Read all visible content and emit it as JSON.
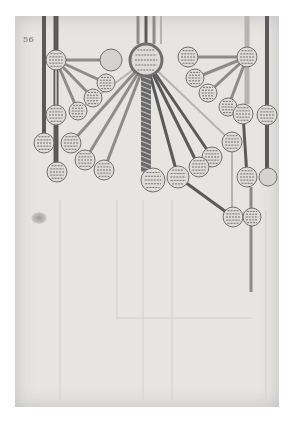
{
  "document": {
    "type": "manuscript-facsimile",
    "page_number": "56",
    "description": "Genealogical tree diagram with central braided trunk and roundel medallions connected by bars",
    "colors": {
      "background": "#ffffff",
      "parchment": "#e6e5e2",
      "ink_dark": "#5a5a5a",
      "bar_mid": "#8c8c8c",
      "bar_light": "#b4b4b4",
      "roundel_fill": "#dedcd8"
    },
    "central_roundel": {
      "label": "illegible manuscript text",
      "x": 146,
      "y": 60,
      "r": 16
    },
    "trunk": {
      "x": 146,
      "top": 76,
      "bottom": 172
    },
    "base_roundel": {
      "label": "illegible manuscript text",
      "x": 153,
      "y": 180,
      "r": 12
    },
    "roundels": [
      {
        "id": "l1",
        "x": 56,
        "y": 60,
        "r": 10,
        "label": "illegible manuscript text"
      },
      {
        "id": "l2",
        "x": 111,
        "y": 60,
        "r": 11,
        "label": "",
        "empty": true
      },
      {
        "id": "l3",
        "x": 106,
        "y": 83,
        "r": 9,
        "label": "illegible manuscript text"
      },
      {
        "id": "l4",
        "x": 93,
        "y": 98,
        "r": 9,
        "label": "illegible manuscript text"
      },
      {
        "id": "l5",
        "x": 78,
        "y": 111,
        "r": 9,
        "label": "illegible manuscript text"
      },
      {
        "id": "l6",
        "x": 56,
        "y": 115,
        "r": 10,
        "label": "illegible manuscript text"
      },
      {
        "id": "l7",
        "x": 44,
        "y": 143,
        "r": 10,
        "label": "illegible manuscript text"
      },
      {
        "id": "l8",
        "x": 71,
        "y": 143,
        "r": 10,
        "label": "illegible manuscript text"
      },
      {
        "id": "l9",
        "x": 85,
        "y": 160,
        "r": 10,
        "label": "illegible manuscript text"
      },
      {
        "id": "l10",
        "x": 104,
        "y": 170,
        "r": 10,
        "label": "illegible manuscript text"
      },
      {
        "id": "l11",
        "x": 57,
        "y": 172,
        "r": 10,
        "label": "illegible manuscript text"
      },
      {
        "id": "r1",
        "x": 188,
        "y": 57,
        "r": 10,
        "label": "illegible manuscript text"
      },
      {
        "id": "r2",
        "x": 247,
        "y": 57,
        "r": 10,
        "label": "illegible manuscript text"
      },
      {
        "id": "r3",
        "x": 195,
        "y": 78,
        "r": 9,
        "label": "illegible manuscript text"
      },
      {
        "id": "r4",
        "x": 208,
        "y": 93,
        "r": 9,
        "label": "illegible manuscript text"
      },
      {
        "id": "r5",
        "x": 228,
        "y": 107,
        "r": 9,
        "label": "illegible manuscript text"
      },
      {
        "id": "r6",
        "x": 243,
        "y": 114,
        "r": 10,
        "label": "illegible manuscript text"
      },
      {
        "id": "r7",
        "x": 267,
        "y": 115,
        "r": 10,
        "label": "illegible manuscript text"
      },
      {
        "id": "r8",
        "x": 232,
        "y": 142,
        "r": 10,
        "label": "illegible manuscript text"
      },
      {
        "id": "r9",
        "x": 212,
        "y": 157,
        "r": 10,
        "label": "illegible manuscript text"
      },
      {
        "id": "r10",
        "x": 199,
        "y": 167,
        "r": 10,
        "label": "illegible manuscript text"
      },
      {
        "id": "r11",
        "x": 178,
        "y": 177,
        "r": 11,
        "label": "illegible manuscript text"
      },
      {
        "id": "r12",
        "x": 247,
        "y": 177,
        "r": 10,
        "label": "illegible manuscript text"
      },
      {
        "id": "r13",
        "x": 268,
        "y": 177,
        "r": 9,
        "label": "",
        "empty": true
      },
      {
        "id": "r14",
        "x": 233,
        "y": 217,
        "r": 10,
        "label": "illegible manuscript text"
      },
      {
        "id": "r15",
        "x": 252,
        "y": 217,
        "r": 9,
        "label": "illegible manuscript text"
      }
    ],
    "vertical_bars": [
      {
        "x": 44,
        "top": 16,
        "bottom": 136,
        "w": 4,
        "tone": "ink_dark"
      },
      {
        "x": 56,
        "top": 16,
        "bottom": 163,
        "w": 5,
        "tone": "ink_dark"
      },
      {
        "x": 138,
        "top": 16,
        "bottom": 44,
        "w": 3,
        "tone": "bar_mid"
      },
      {
        "x": 146,
        "top": 16,
        "bottom": 44,
        "w": 3,
        "tone": "ink_dark"
      },
      {
        "x": 154,
        "top": 16,
        "bottom": 44,
        "w": 3,
        "tone": "bar_mid"
      },
      {
        "x": 161,
        "top": 16,
        "bottom": 44,
        "w": 2,
        "tone": "bar_light"
      },
      {
        "x": 247,
        "top": 16,
        "bottom": 104,
        "w": 5,
        "tone": "bar_light"
      },
      {
        "x": 267,
        "top": 16,
        "bottom": 168,
        "w": 4,
        "tone": "ink_dark"
      },
      {
        "x": 232,
        "top": 152,
        "bottom": 207,
        "w": 2,
        "tone": "bar_light"
      },
      {
        "x": 251,
        "top": 187,
        "bottom": 292,
        "w": 3,
        "tone": "bar_mid"
      }
    ]
  }
}
